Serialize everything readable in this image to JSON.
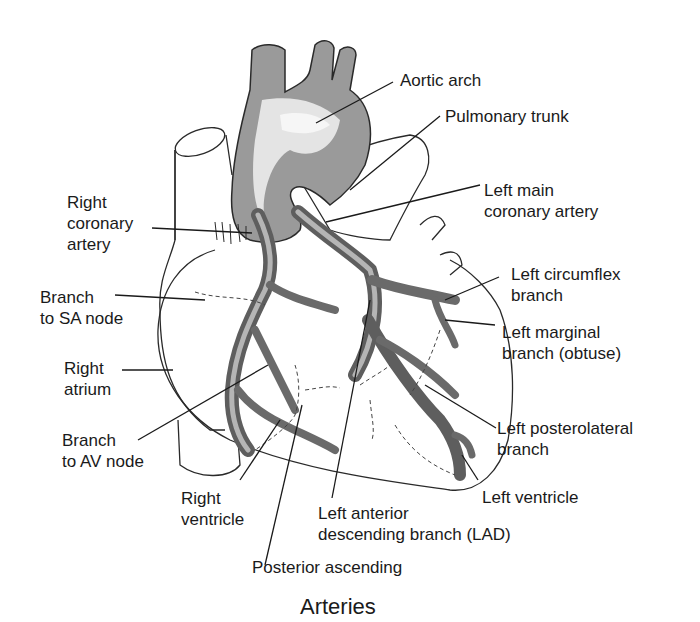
{
  "diagram": {
    "caption": "Arteries",
    "labels": {
      "aortic_arch": [
        "Aortic arch"
      ],
      "pulmonary_trunk": [
        "Pulmonary trunk"
      ],
      "left_main_coronary_artery": [
        "Left main",
        "coronary artery"
      ],
      "left_circumflex_branch": [
        "Left circumflex",
        "branch"
      ],
      "left_marginal_branch": [
        "Left marginal",
        "branch (obtuse)"
      ],
      "left_posterolateral_branch": [
        "Left posterolateral",
        "branch"
      ],
      "left_ventricle": [
        "Left ventricle"
      ],
      "lad": [
        "Left anterior",
        "descending branch (LAD)"
      ],
      "posterior_ascending": [
        "Posterior ascending"
      ],
      "right_ventricle": [
        "Right",
        "ventricle"
      ],
      "branch_to_av_node": [
        "Branch",
        "to AV node"
      ],
      "right_atrium": [
        "Right",
        "atrium"
      ],
      "branch_to_sa_node": [
        "Branch",
        "to SA node"
      ],
      "right_coronary_artery": [
        "Right",
        "coronary",
        "artery"
      ]
    },
    "colors": {
      "artery_dark": "#7a7a7a",
      "artery_mid": "#a8a8a8",
      "artery_light": "#e6e6e6",
      "outline": "#2a2a2a"
    }
  }
}
